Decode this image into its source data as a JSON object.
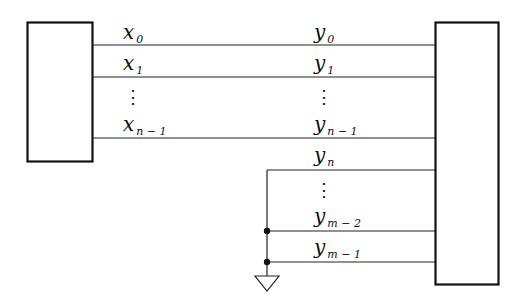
{
  "diagram": {
    "type": "block-interconnect",
    "left_block": {
      "label": ""
    },
    "right_block": {
      "label": ""
    },
    "left_signals": [
      {
        "base": "x",
        "sub": "0"
      },
      {
        "base": "x",
        "sub": "1"
      },
      {
        "base": "⋮",
        "sub": ""
      },
      {
        "base": "x",
        "sub": "n − 1"
      }
    ],
    "right_signals": [
      {
        "base": "y",
        "sub": "0"
      },
      {
        "base": "y",
        "sub": "1"
      },
      {
        "base": "⋮",
        "sub": ""
      },
      {
        "base": "y",
        "sub": "n − 1"
      },
      {
        "base": "y",
        "sub": "n"
      },
      {
        "base": "⋮",
        "sub": ""
      },
      {
        "base": "y",
        "sub": "m − 2"
      },
      {
        "base": "y",
        "sub": "m − 1"
      }
    ],
    "ground": {
      "symbol": "ground-triangle",
      "tied_signals": [
        "y_n",
        "y_m-2",
        "y_m-1"
      ]
    },
    "colors": {
      "line": "#111111",
      "background": "#ffffff"
    }
  }
}
